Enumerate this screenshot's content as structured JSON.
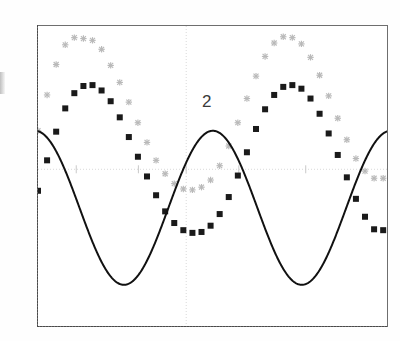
{
  "figure": {
    "inline_label": "2",
    "left_edge_partial_mark": "cropped-axis-label",
    "background_color": "#ffffff",
    "frame_color": "#6e6e6e"
  },
  "chart_data": {
    "type": "line",
    "title": "",
    "subtitle": "",
    "xlabel": "",
    "ylabel": "",
    "annotations": [
      {
        "text": "2",
        "x_px": 170,
        "y_px": 80
      }
    ],
    "legend_position": "none",
    "legend_entries": [],
    "grid": {
      "enabled": true,
      "style": "faint",
      "horizontal_gridlines_y": [
        0.0
      ],
      "vertical_gridlines_x": [
        3.1
      ],
      "tick_marks_x": [
        0.8,
        2.1,
        3.1,
        4.2,
        5.6
      ],
      "color": "#d9d9d9"
    },
    "xlim": [
      0.0,
      7.3
    ],
    "ylim": [
      -1.75,
      1.6
    ],
    "x": [
      0.0,
      0.19,
      0.38,
      0.57,
      0.76,
      0.95,
      1.14,
      1.33,
      1.52,
      1.71,
      1.9,
      2.09,
      2.28,
      2.47,
      2.66,
      2.85,
      3.04,
      3.23,
      3.42,
      3.61,
      3.8,
      3.99,
      4.18,
      4.37,
      4.56,
      4.75,
      4.94,
      5.13,
      5.32,
      5.51,
      5.7,
      5.89,
      6.08,
      6.27,
      6.46,
      6.65,
      6.84,
      7.03,
      7.22
    ],
    "series": [
      {
        "name": "series-light-asterisk",
        "marker": "asterisk",
        "color": "#b9b9b9",
        "linestyle": "none",
        "amplitude": 0.86,
        "offset": 0.62,
        "phase_deg": 50,
        "period": 3.72,
        "values": [
          0.43,
          0.83,
          1.17,
          1.39,
          1.47,
          1.46,
          1.44,
          1.34,
          1.16,
          0.97,
          0.75,
          0.52,
          0.3,
          0.1,
          -0.05,
          -0.16,
          -0.22,
          -0.23,
          -0.2,
          -0.12,
          0.04,
          0.26,
          0.52,
          0.79,
          1.04,
          1.26,
          1.41,
          1.48,
          1.47,
          1.4,
          1.25,
          1.05,
          0.82,
          0.57,
          0.33,
          0.12,
          -0.02,
          -0.1,
          -0.1
        ]
      },
      {
        "name": "series-dark-square",
        "marker": "square",
        "color": "#1a1a1a",
        "linestyle": "none",
        "amplitude": 0.86,
        "offset": 0.07,
        "phase_deg": 18,
        "period": 3.72,
        "values": [
          -0.24,
          0.1,
          0.42,
          0.68,
          0.85,
          0.93,
          0.94,
          0.88,
          0.76,
          0.58,
          0.36,
          0.14,
          -0.08,
          -0.29,
          -0.47,
          -0.6,
          -0.68,
          -0.71,
          -0.7,
          -0.63,
          -0.5,
          -0.31,
          -0.07,
          0.19,
          0.45,
          0.67,
          0.83,
          0.92,
          0.94,
          0.9,
          0.79,
          0.62,
          0.4,
          0.16,
          -0.09,
          -0.33,
          -0.53,
          -0.67,
          -0.68
        ]
      },
      {
        "name": "series-solid-curve",
        "marker": "none",
        "color": "#111111",
        "linestyle": "solid",
        "amplitude": 0.86,
        "offset": -0.43,
        "phase_deg": 96,
        "period": 3.72,
        "values": [
          0.42,
          0.4,
          0.26,
          0.04,
          -0.24,
          -0.54,
          -0.84,
          -1.09,
          -1.25,
          -1.3,
          -1.25,
          -1.09,
          -0.84,
          -0.54,
          -0.24,
          0.05,
          0.26,
          0.4,
          0.43,
          0.36,
          0.19,
          -0.07,
          -0.37,
          -0.68,
          -0.97,
          -1.18,
          -1.29,
          -1.28,
          -1.16,
          -0.94,
          -0.65,
          -0.34,
          -0.05,
          0.19,
          0.35,
          0.43,
          0.41,
          0.3,
          0.1
        ]
      }
    ]
  }
}
